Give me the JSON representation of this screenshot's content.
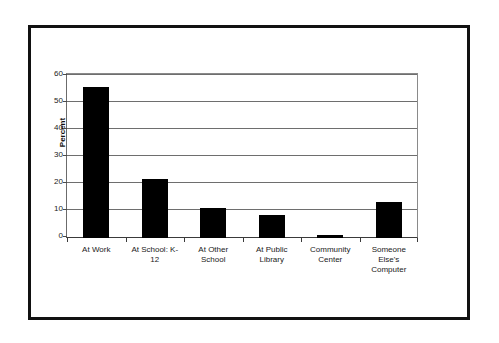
{
  "chart_data": {
    "type": "bar",
    "title": "",
    "xlabel": "",
    "ylabel": "Percent",
    "ylim": [
      0,
      60
    ],
    "yticks": [
      0,
      10,
      20,
      30,
      40,
      50,
      60
    ],
    "ytick_labels": [
      "0",
      "10",
      "20",
      "30",
      "40",
      "50",
      "60"
    ],
    "grid": true,
    "legend": false,
    "categories": [
      "At Work",
      "At School: K-12",
      "At Other School",
      "At Public Library",
      "Community Center",
      "Someone Else's Computer"
    ],
    "category_label_lines": [
      [
        "At Work"
      ],
      [
        "At School: K-",
        "12"
      ],
      [
        "At Other",
        "School"
      ],
      [
        "At Public",
        "Library"
      ],
      [
        "Community",
        "Center"
      ],
      [
        "Someone",
        "Else's",
        "Computer"
      ]
    ],
    "values": [
      56,
      22,
      11,
      8.5,
      1,
      13.5
    ],
    "bar_color": "#000000",
    "plot_background": "#ffffff",
    "gridline_color": "#6e6e6e",
    "frame_color": "#111111"
  }
}
